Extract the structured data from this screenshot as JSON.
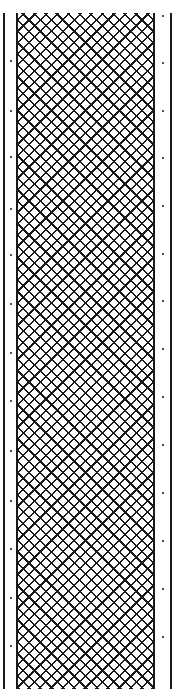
{
  "figure": {
    "colors": {
      "ink": "#1a1a1a",
      "background": "#ffffff"
    },
    "hatch": {
      "pattern": "crosshatch-diamond",
      "spacing_px": 8
    },
    "left_dots_y": [
      13,
      60,
      110,
      156,
      208,
      254,
      303,
      352,
      400,
      450,
      500,
      548,
      597,
      645,
      688
    ],
    "right_dots_y": [
      15,
      62,
      110,
      157,
      205,
      253,
      300,
      348,
      396,
      444,
      492,
      540,
      588,
      636,
      684
    ]
  }
}
